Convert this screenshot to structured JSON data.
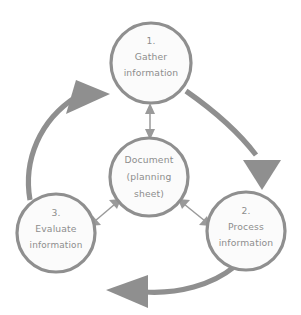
{
  "diagram": {
    "colors": {
      "stroke": "#8f8f8f",
      "node_fill": "#fbfbfb",
      "text": "#8d8d8d",
      "link": "#9a9a9a",
      "background": "#ffffff"
    },
    "nodes": [
      {
        "id": "gather",
        "number": "1.",
        "lines": [
          "1.",
          "Gather",
          "information"
        ],
        "cx": 151,
        "cy": 63,
        "r": 40
      },
      {
        "id": "process",
        "number": "2.",
        "lines": [
          "2.",
          "Process",
          "information"
        ],
        "cx": 246,
        "cy": 231,
        "r": 39
      },
      {
        "id": "evaluate",
        "number": "3.",
        "lines": [
          "3.",
          "Evaluate",
          "information"
        ],
        "cx": 56,
        "cy": 233,
        "r": 39
      },
      {
        "id": "document",
        "number": "",
        "lines": [
          "Document",
          "(planning",
          "sheet)"
        ],
        "cx": 149,
        "cy": 177,
        "r": 39
      }
    ],
    "cycle_arrows": [
      {
        "id": "gather-to-process",
        "from": "gather",
        "to": "process",
        "direction": "clockwise"
      },
      {
        "id": "process-to-evaluate",
        "from": "process",
        "to": "evaluate",
        "direction": "clockwise"
      },
      {
        "id": "evaluate-to-gather",
        "from": "evaluate",
        "to": "gather",
        "direction": "clockwise"
      }
    ],
    "document_links": [
      {
        "id": "document-gather-link",
        "between": [
          "document",
          "gather"
        ],
        "bidirectional": true
      },
      {
        "id": "document-process-link",
        "between": [
          "document",
          "process"
        ],
        "bidirectional": true
      },
      {
        "id": "document-evaluate-link",
        "between": [
          "document",
          "evaluate"
        ],
        "bidirectional": true
      }
    ]
  }
}
